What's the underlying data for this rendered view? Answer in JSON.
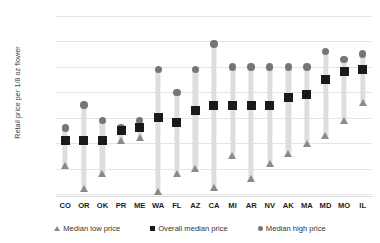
{
  "chart_data": {
    "type": "bar",
    "title": "",
    "subtitle": "",
    "xlabel": "",
    "ylabel": "Retail price per 1/8 oz flower",
    "ylim": [
      10,
      80
    ],
    "ytick_values": [
      10,
      20,
      30,
      40,
      50,
      60,
      70,
      80
    ],
    "ytick_labels": [
      "$10",
      "$20",
      "$30",
      "$40",
      "$50",
      "$60",
      "$70",
      "$80"
    ],
    "grid": true,
    "legend_position": "bottom",
    "categories": [
      "CO",
      "OR",
      "OK",
      "PR",
      "ME",
      "WA",
      "FL",
      "AZ",
      "CA",
      "MI",
      "AR",
      "NV",
      "AK",
      "MA",
      "MD",
      "MO",
      "IL"
    ],
    "series": [
      {
        "name": "Median low price",
        "marker": "triangle",
        "color": "#8a8a8a",
        "values": [
          21,
          12,
          18,
          31,
          32,
          11,
          18,
          20,
          12.5,
          25,
          16,
          22,
          26,
          30,
          33,
          39,
          46
        ]
      },
      {
        "name": "Overall median price",
        "marker": "square",
        "color": "#1a1a1a",
        "values": [
          31,
          31,
          31,
          35,
          36,
          40,
          38,
          43,
          45,
          45,
          45,
          45,
          48,
          49,
          55,
          58,
          59
        ]
      },
      {
        "name": "Median high price",
        "marker": "circle",
        "color": "#767676",
        "values": [
          36,
          45,
          39,
          36,
          39,
          59,
          50,
          59,
          69,
          60,
          60,
          60,
          60,
          60,
          66,
          63,
          65
        ]
      }
    ]
  },
  "legend": {
    "items": [
      {
        "label": "Median low price",
        "marker": "triangle-icon"
      },
      {
        "label": "Overall median price",
        "marker": "square-icon"
      },
      {
        "label": "Median high price",
        "marker": "circle-icon"
      }
    ]
  }
}
